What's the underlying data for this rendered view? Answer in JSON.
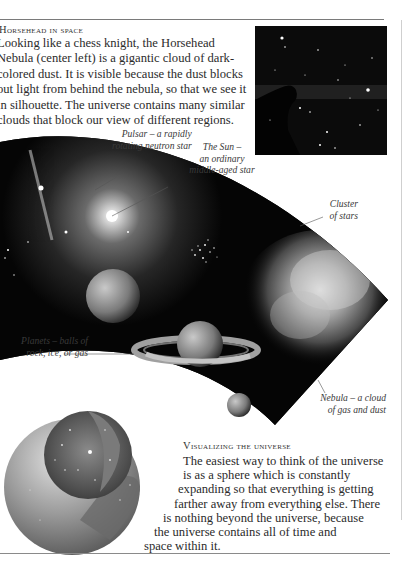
{
  "horsehead": {
    "title": "Horsehead in space",
    "lines": [
      "Looking like a chess knight, the Horsehead",
      "Nebula (center left) is a gigantic cloud of dark-",
      "colored dust. It is visible because the dust blocks",
      "out light from behind the nebula, so that we see it",
      "in silhouette. The universe contains many similar",
      "clouds that block our view of different regions."
    ]
  },
  "labels": {
    "pulsar": [
      "Pulsar – a rapidly",
      "rotating neutron star"
    ],
    "sun": [
      "The Sun –",
      "an ordinary",
      "middle-aged star"
    ],
    "cluster": [
      "Cluster",
      "of stars"
    ],
    "planets": [
      "Planets – balls of",
      "rock, ice, or gas"
    ],
    "nebula": [
      "Nebula – a cloud",
      "of gas and dust"
    ]
  },
  "visualizing": {
    "title": "Visualizing the universe",
    "lines": [
      "The easiest way to think of the universe",
      "is as a sphere which is constantly",
      "expanding so that everything is getting",
      "farther away from everything else. There",
      "is nothing beyond the universe, because",
      "the universe contains all of time and",
      "space within it."
    ]
  },
  "colors": {
    "space": "#050505",
    "paper": "#ffffff",
    "text": "#2b2b2b"
  }
}
